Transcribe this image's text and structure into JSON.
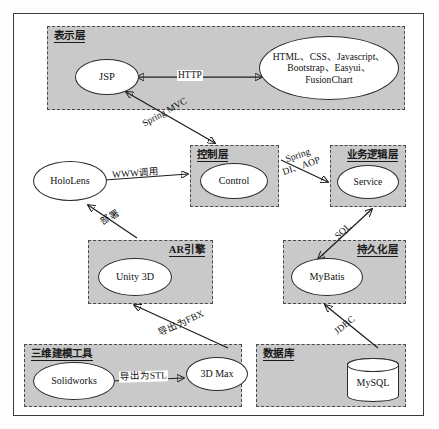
{
  "diagram": {
    "type": "layered-architecture"
  },
  "layers": [
    {
      "id": "presentation",
      "title": "表示层",
      "title_align": "left"
    },
    {
      "id": "control",
      "title": "控制层",
      "title_align": "left"
    },
    {
      "id": "business",
      "title": "业务逻辑层",
      "title_align": "right"
    },
    {
      "id": "ar_engine",
      "title": "AR引擎",
      "title_align": "right"
    },
    {
      "id": "persistence",
      "title": "持久化层",
      "title_align": "right"
    },
    {
      "id": "modeling",
      "title": "三维建模工具",
      "title_align": "left"
    },
    {
      "id": "database",
      "title": "数据库",
      "title_align": "left"
    }
  ],
  "nodes": {
    "jsp": {
      "label": "JSP"
    },
    "frontend": {
      "line1": "HTML、CSS、Javascript、",
      "line2": "Bootstrap、Easyui、",
      "line3": "FusionChart"
    },
    "hololens": {
      "label": "HoloLens"
    },
    "control": {
      "label": "Control"
    },
    "service": {
      "label": "Service"
    },
    "unity": {
      "label": "Unity 3D"
    },
    "mybatis": {
      "label": "MyBatis"
    },
    "solidworks": {
      "label": "Solidworks"
    },
    "max3d": {
      "label": "3D Max"
    },
    "mysql": {
      "label": "MySQL"
    }
  },
  "edges": [
    {
      "id": "http",
      "label": "HTTP",
      "from": "frontend",
      "to": "jsp",
      "arrow": "both"
    },
    {
      "id": "spring_mvc",
      "label": "Spring MVC",
      "from": "control",
      "to": "jsp",
      "arrow": "both"
    },
    {
      "id": "www_call",
      "label": "WWW调用",
      "from": "hololens",
      "to": "control",
      "arrow": "end"
    },
    {
      "id": "spring_di",
      "label_line1": "Spring",
      "label_line2": "DI、AOP",
      "from": "control",
      "to": "service",
      "arrow": "end"
    },
    {
      "id": "sql",
      "label": "SQL",
      "from": "service",
      "to": "mybatis",
      "arrow": "both"
    },
    {
      "id": "deploy",
      "label": "部署",
      "from": "unity",
      "to": "hololens",
      "arrow": "end"
    },
    {
      "id": "export_fbx",
      "label": "导出为FBX",
      "from": "max3d",
      "to": "unity",
      "arrow": "end"
    },
    {
      "id": "jdbc",
      "label": "JDBC",
      "from": "mysql",
      "to": "mybatis",
      "arrow": "end"
    },
    {
      "id": "export_stl",
      "label": "导出为STL",
      "from": "solidworks",
      "to": "max3d",
      "arrow": "end"
    }
  ],
  "colors": {
    "layer_fill": "#c9c9c9",
    "node_fill": "#ffffff",
    "stroke": "#1d1d1d",
    "frame": "#3b3b3b"
  }
}
